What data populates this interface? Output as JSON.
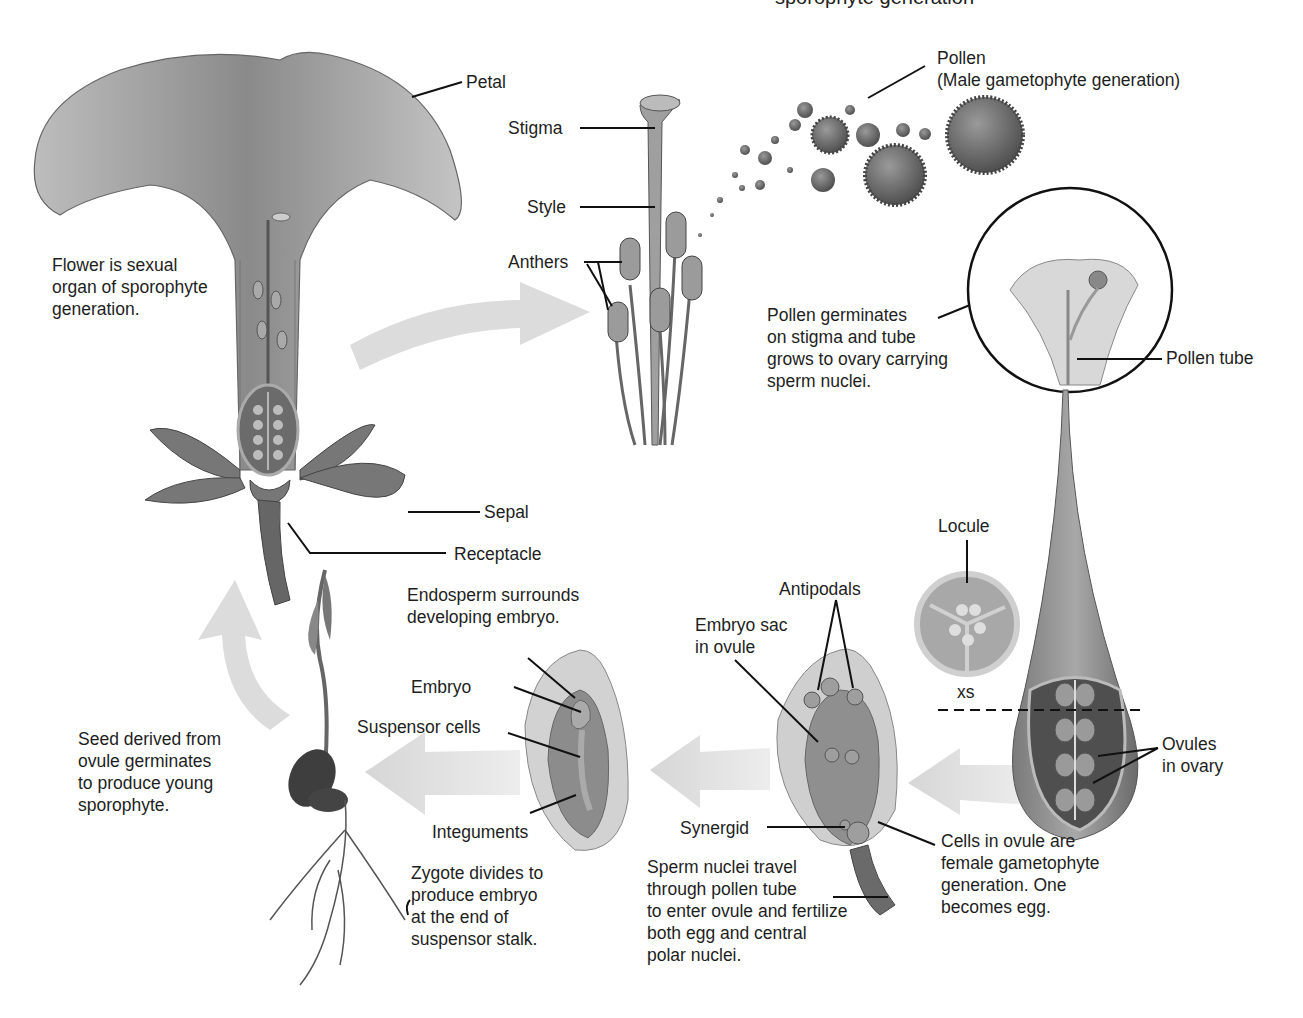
{
  "figure": {
    "title_clipped": "sporophyte generation",
    "colors": {
      "arrow": "#d9d9d9",
      "ink": "#1e1e1e",
      "tissue_light": "#cfcfcf",
      "tissue_mid": "#9a9a9a",
      "tissue_dark": "#5e5e5e"
    }
  },
  "labels": {
    "petal": "Petal",
    "flower_note": "Flower is sexual\norgan of sporophyte\ngeneration.",
    "stigma": "Stigma",
    "style": "Style",
    "anthers": "Anthers",
    "pollen": "Pollen\n(Male gametophyte generation)",
    "pollen_germinates": "Pollen germinates\non stigma and tube\ngrows to ovary carrying\nsperm nuclei.",
    "pollen_tube": "Pollen tube",
    "sepal": "Sepal",
    "receptacle": "Receptacle",
    "locule": "Locule",
    "xs": "xs",
    "ovules_in_ovary": "Ovules\nin ovary",
    "antipodals": "Antipodals",
    "embryo_sac": "Embryo sac\nin ovule",
    "synergid": "Synergid",
    "cells_in_ovule": "Cells in ovule are\nfemale gametophyte\ngeneration. One\nbecomes egg.",
    "sperm_nuclei": "Sperm nuclei travel\nthrough pollen tube\nto enter ovule and fertilize\nboth egg and central\npolar nuclei.",
    "endosperm": "Endosperm surrounds\ndeveloping embryo.",
    "embryo": "Embryo",
    "suspensor_cells": "Suspensor cells",
    "integuments": "Integuments",
    "zygote_divides": "Zygote divides to\nproduce embryo\nat the end of\nsuspensor stalk.",
    "seed_derived": "Seed derived from\novule germinates\nto produce young\nsporophyte."
  }
}
